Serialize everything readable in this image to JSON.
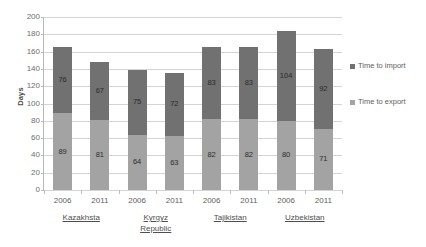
{
  "chart_data": {
    "type": "bar",
    "stacked": true,
    "title": "",
    "xlabel": "",
    "ylabel": "Days",
    "ylim": [
      0,
      200
    ],
    "ytick_step": 20,
    "yticks": [
      0,
      20,
      40,
      60,
      80,
      100,
      120,
      140,
      160,
      180,
      200
    ],
    "grid": true,
    "legend_position": "right",
    "categories": [
      "2006",
      "2011",
      "2006",
      "2011",
      "2006",
      "2011",
      "2006",
      "2011"
    ],
    "groups": [
      {
        "country": "Kazakhsta",
        "years": [
          "2006",
          "2011"
        ]
      },
      {
        "country": "Kyrgyz Republic",
        "years": [
          "2006",
          "2011"
        ]
      },
      {
        "country": "Tajikistan",
        "years": [
          "2006",
          "2011"
        ]
      },
      {
        "country": "Uzbekistan",
        "years": [
          "2006",
          "2011"
        ]
      }
    ],
    "series": [
      {
        "name": "Time to export",
        "color": "#a3a3a3",
        "values": [
          89,
          81,
          64,
          63,
          82,
          82,
          80,
          71
        ]
      },
      {
        "name": "Time to import",
        "color": "#717171",
        "values": [
          76,
          67,
          75,
          72,
          83,
          83,
          104,
          92
        ]
      }
    ],
    "totals": [
      165,
      148,
      139,
      135,
      165,
      165,
      184,
      163
    ]
  },
  "axis": {
    "y_title": "Days",
    "y_tick_labels": [
      "200",
      "180",
      "160",
      "140",
      "120",
      "100",
      "80",
      "60",
      "40",
      "20",
      "0"
    ],
    "x_tick_labels": [
      "2006",
      "2011",
      "2006",
      "2011",
      "2006",
      "2011",
      "2006",
      "2011"
    ]
  },
  "country_labels": [
    {
      "line1": "Kazakhsta",
      "line2": ""
    },
    {
      "line1": "Kyrgyz",
      "line2": "Republic"
    },
    {
      "line1": "Tajikistan",
      "line2": ""
    },
    {
      "line1": "Uzbekistan",
      "line2": ""
    }
  ],
  "legend": {
    "items": [
      {
        "label": "Time to import",
        "color": "#717171"
      },
      {
        "label": "Time to export",
        "color": "#a3a3a3"
      }
    ]
  },
  "bar_labels": {
    "import": [
      "76",
      "67",
      "75",
      "72",
      "83",
      "83",
      "104",
      "92"
    ],
    "export": [
      "89",
      "81",
      "64",
      "63",
      "82",
      "82",
      "80",
      "71"
    ]
  }
}
